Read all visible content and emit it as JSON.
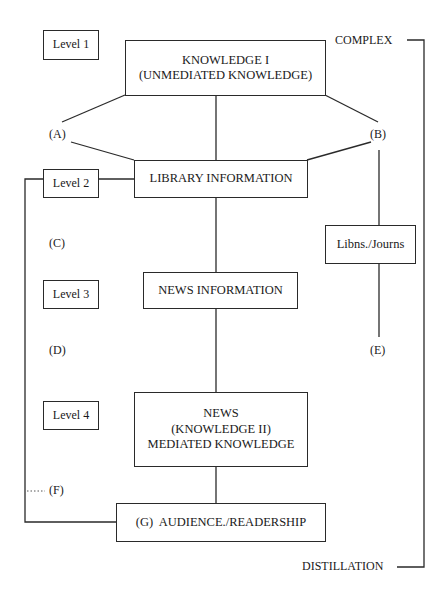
{
  "levels": {
    "l1": "Level 1",
    "l2": "Level 2",
    "l3": "Level 3",
    "l4": "Level 4"
  },
  "nodes": {
    "knowledge1": {
      "line1": "KNOWLEDGE I",
      "line2": "(UNMEDIATED KNOWLEDGE)"
    },
    "library": "LIBRARY INFORMATION",
    "news_info": "NEWS INFORMATION",
    "news": {
      "line1": "NEWS",
      "line2": "(KNOWLEDGE II)",
      "line3": "MEDIATED KNOWLEDGE"
    },
    "audience": "(G)  AUDIENCE./READERSHIP",
    "libns": "Libns./Journs"
  },
  "markers": {
    "a": "(A)",
    "b": "(B)",
    "c": "(C)",
    "d": "(D)",
    "e": "(E)",
    "f": "(F)",
    "f_dots": "....."
  },
  "bracket": {
    "top": "COMPLEX",
    "bottom": "DISTILLATION"
  }
}
